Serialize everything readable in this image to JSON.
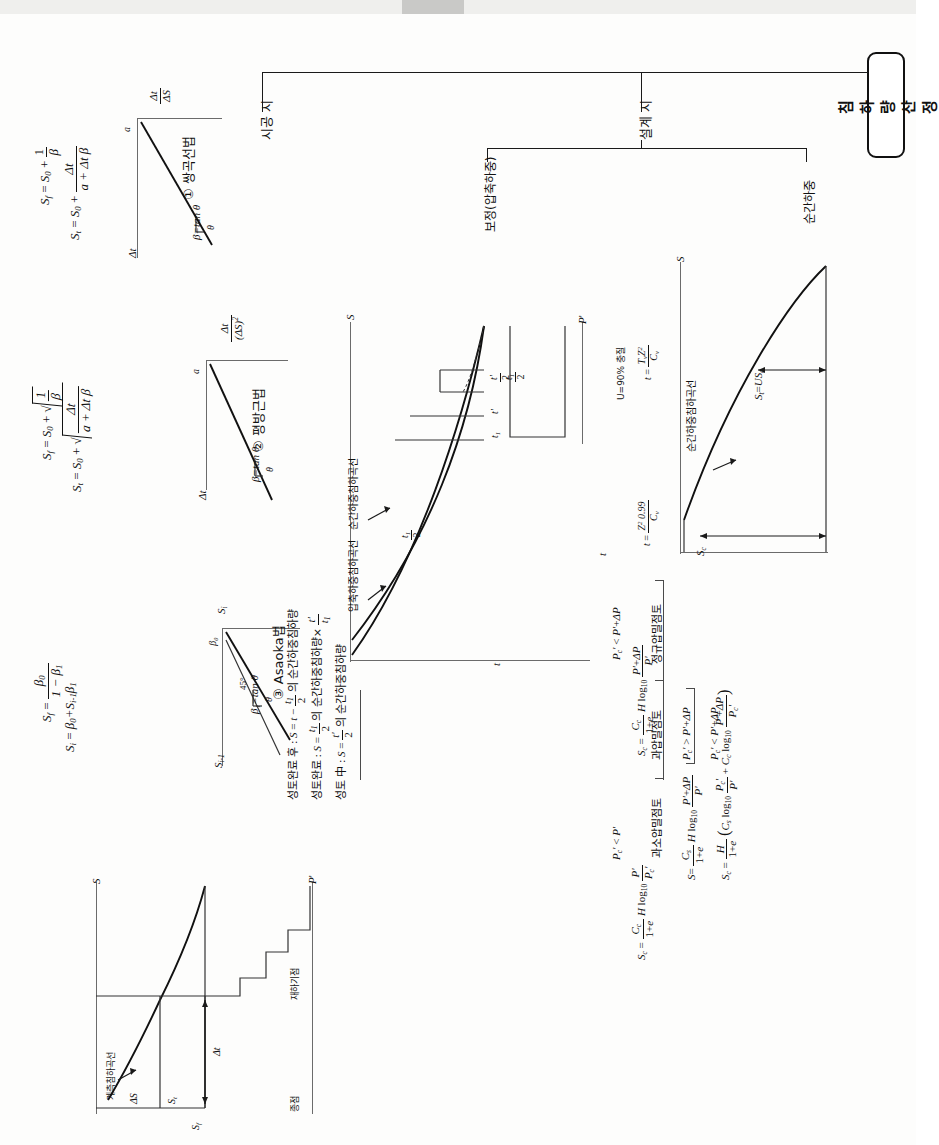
{
  "document": {
    "title_tag": "침하량 산정",
    "language": "ko"
  },
  "tree": {
    "root_label": "침하량 산정",
    "branches": [
      {
        "id": "construction",
        "label": "시공 시"
      },
      {
        "id": "design",
        "label": "설계 시"
      }
    ],
    "design_children": [
      {
        "id": "correction",
        "label": "보정(압축하중)"
      },
      {
        "id": "instant",
        "label": "순간하중"
      }
    ]
  },
  "methods": [
    {
      "index": "①",
      "name": "쌍곡선법",
      "axis_x": "Δt",
      "axis_y": "Δt/ΔS",
      "slope_label": "β=tan θ",
      "intercept_label": "a",
      "angle_label": "θ",
      "formulas": [
        "S_t = S_0 + Δt/(a + Δt·β)",
        "S_f = S_0 + 1/β"
      ],
      "formula_parts": {
        "f1_lhs": "S",
        "f1_lhs_sub": "t",
        "f1_add": "S",
        "f1_add_sub": "0",
        "f1_num": "Δt",
        "f1_den": "a + Δt β",
        "f2_lhs": "S",
        "f2_lhs_sub": "f",
        "f2_add": "S",
        "f2_add_sub": "0",
        "f2_num": "1",
        "f2_den": "β"
      }
    },
    {
      "index": "②",
      "name": "평방근법",
      "axis_x": "Δt",
      "axis_y": "Δt/(ΔS)²",
      "slope_label": "β=tan θ",
      "intercept_label": "a",
      "angle_label": "θ",
      "formulas": [
        "S_t = S_0 + √( Δt/(a + Δt·β) )",
        "S_f = S_0 + √(1/β)"
      ],
      "formula_parts": {
        "f1_lhs": "S",
        "f1_lhs_sub": "t",
        "f1_add": "S",
        "f1_add_sub": "0",
        "f1_num": "Δt",
        "f1_den": "a + Δt β",
        "f2_lhs": "S",
        "f2_lhs_sub": "f",
        "f2_add": "S",
        "f2_add_sub": "0",
        "f2_num": "1",
        "f2_den": "β"
      }
    },
    {
      "index": "③",
      "name": "Asaoka법",
      "axis_x": "S_i",
      "axis_y": "S_{i-1}",
      "slope_label": "β₁=tan θ",
      "intercept_label": "β₀",
      "angle_label": "θ",
      "guide_label": "45°",
      "formulas": [
        "S_i = β₀ + S_{i-1} β₁",
        "S_f = β₀ / (1 - β₁)"
      ],
      "formula_parts": {
        "f1_lhs": "S",
        "f1_lhs_sub": "i",
        "f1_rhs": "β₀+S",
        "f1_rhs_sub": "i-1",
        "f1_rhs_tail": "β₁",
        "f2_lhs": "S",
        "f2_lhs_sub": "f",
        "f2_num": "β₀",
        "f2_den": "1 − β₁"
      }
    }
  ],
  "correction_chart": {
    "axis_top": "S",
    "axis_right": "P",
    "axis_right_prime": "'",
    "axis_bottom": "t",
    "curve_labels": [
      "순간하중침하곡선",
      "압축하중침하곡선"
    ],
    "tick_labels": [
      "t'",
      "t₁",
      "t'/2",
      "t₁/2",
      "t₁/2"
    ],
    "notes": [
      {
        "label": "성토 中",
        "text": "S = t'/2 의 순간하중침하량"
      },
      {
        "label": "성토완료",
        "text": "S = t₁/2 의 순간하중침하량 × t'/t₁"
      },
      {
        "label": "성토완료 후",
        "text": "S = t − t₁/2 의 순간하중침하량"
      }
    ]
  },
  "instant_chart": {
    "axis_top": "S",
    "axis_bottom": "t",
    "curve_label": "순간하중침하곡선",
    "settlement_label": "S_t = U·S_c",
    "total_label": "S_c",
    "time_markers": [
      {
        "label": "t = (T_v Z²)/C_v",
        "note": "U=90% 충질"
      },
      {
        "label": "t = (Z² 0.99)/C_v",
        "note": "0.99"
      }
    ],
    "marker_raw": [
      "t =",
      "T",
      "v",
      "Z",
      "2",
      "C",
      "v",
      "0.99"
    ]
  },
  "consolidation": {
    "cases": [
      {
        "id": "normally-consolidated",
        "label": "정규압밀점토",
        "condition": "P_c' < P' + ΔP",
        "formula": "S_c = (C_c/(1+e)) H log₁₀ ((P'+ΔP)/P')"
      },
      {
        "id": "over-consolidated",
        "label": "과압밀점토",
        "sub_cases": [
          {
            "condition": "P_c' > P' + ΔP",
            "formula": "S_c = (C_s/(1+e)) H log₁₀ ((P'+ΔP)/P')"
          },
          {
            "condition": "P_c' < P' + ΔP",
            "formula": "S_c = (H/(1+e)) ( C_s log₁₀ (P_c'/P') + C_c log₁₀ ((P'+ΔP)/P_c') )"
          }
        ]
      },
      {
        "id": "under-consolidated",
        "label": "과소압밀점토",
        "condition": "P_c' < P'",
        "formula": "S_c = (C_c/(1+e)) H log₁₀ (P'/P_c')"
      }
    ],
    "symbols": {
      "Cc": "C_c",
      "Cs": "C_s",
      "H": "H",
      "e": "e",
      "log": "log₁₀",
      "Pprime": "P'",
      "Pc": "P_c'",
      "dP": "ΔP"
    }
  },
  "construction_chart": {
    "axis_top": "S",
    "axis_right": "P'",
    "labels": [
      {
        "id": "settlement-curve",
        "text": "계측침하곡선"
      },
      {
        "id": "load-increment",
        "text": "재하기점"
      },
      {
        "id": "end",
        "text": "종점"
      }
    ],
    "measures": [
      "ΔS",
      "S_t",
      "S_f",
      "Δt"
    ]
  }
}
